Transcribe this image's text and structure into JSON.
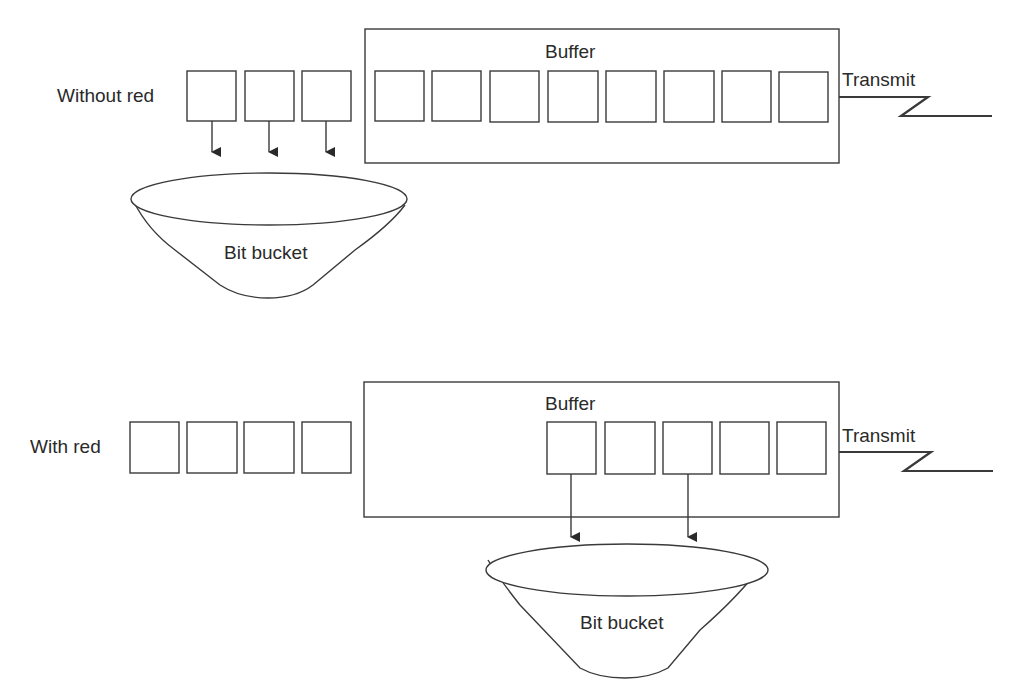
{
  "top": {
    "row_label": "Without red",
    "buffer_label": "Buffer",
    "transmit_label": "Transmit",
    "bucket_label": "Bit bucket",
    "buffer_slots": 8,
    "incoming_packets": 3,
    "dropped_packets": 3
  },
  "bottom": {
    "row_label": "With red",
    "buffer_label": "Buffer",
    "transmit_label": "Transmit",
    "bucket_label": "Bit bucket",
    "buffer_slots": 5,
    "incoming_packets": 4,
    "dropped_from_buffer": 2
  },
  "colors": {
    "stroke": "#3a3a3a",
    "background": "#ffffff"
  }
}
